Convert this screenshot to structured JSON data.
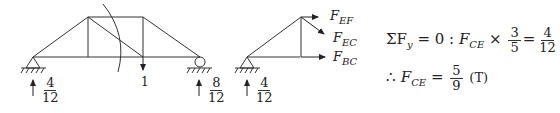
{
  "diagram": {
    "truss_full": {
      "load_label": "1",
      "reaction_left": {
        "num": "4",
        "den": "12"
      },
      "reaction_right": {
        "num": "8",
        "den": "12"
      }
    },
    "free_body": {
      "reaction": {
        "num": "4",
        "den": "12"
      },
      "forces": [
        {
          "name": "F",
          "sub": "EF"
        },
        {
          "name": "F",
          "sub": "EC"
        },
        {
          "name": "F",
          "sub": "BC"
        }
      ]
    }
  },
  "equations": {
    "line1": {
      "sum": "ΣF",
      "sum_sub": "y",
      "eq0": " = 0 : ",
      "F": "F",
      "F_sub": "CE",
      "times": " × ",
      "frac1": {
        "num": "3",
        "den": "5"
      },
      "equals": "=",
      "frac2": {
        "num": "4",
        "den": "12"
      }
    },
    "line2": {
      "therefore": "∴ ",
      "F": "F",
      "F_sub": "CE",
      "equals": " = ",
      "frac": {
        "num": "5",
        "den": "9"
      },
      "type": "(T)"
    }
  }
}
